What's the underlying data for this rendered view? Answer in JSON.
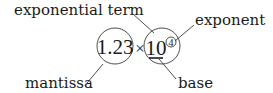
{
  "diagram": {
    "expression": {
      "mantissa": "1.23",
      "operator": "×",
      "base": "10",
      "exponent": "4"
    },
    "labels": {
      "exponential_term": "exponential term",
      "exponent": "exponent",
      "mantissa": "mantissa",
      "base": "base"
    },
    "colors": {
      "text": "#1a1a1a",
      "lines": "#3a3a3a",
      "background": "#ffffff"
    }
  }
}
